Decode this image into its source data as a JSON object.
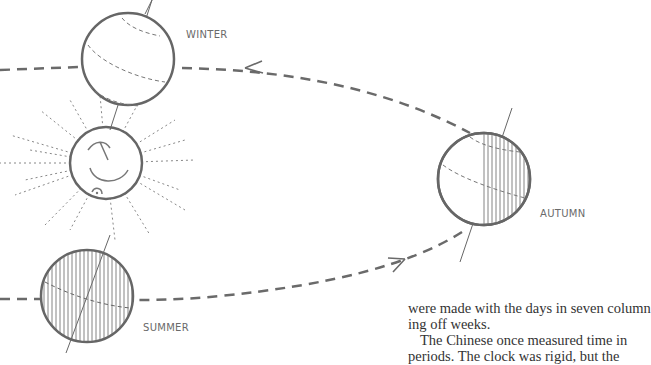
{
  "diagram": {
    "labels": {
      "winter": "WINTER",
      "autumn": "AUTUMN",
      "summer": "SUMMER"
    },
    "stroke_color": "#666666"
  },
  "body_text": {
    "line1": "were made with the days in seven column",
    "line2": "ing off weeks.",
    "line3": "The Chinese once measured time in",
    "line4": "periods. The clock was rigid, but the"
  }
}
